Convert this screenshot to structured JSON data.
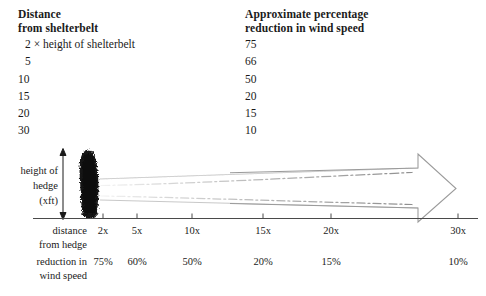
{
  "top_table": {
    "left_column": {
      "header_line1": "Distance",
      "header_line2": "from shelterbelt",
      "rows": [
        "2 × height of shelterbelt",
        "5",
        "10",
        "15",
        "20",
        "30"
      ]
    },
    "right_column": {
      "header_line1": "Approximate percentage",
      "header_line2": "reduction in wind speed",
      "rows": [
        "75",
        "66",
        "50",
        "20",
        "15",
        "10"
      ]
    }
  },
  "diagram": {
    "hedge_label": {
      "line1": "height of",
      "line2": "hedge",
      "line3": "(xft)"
    },
    "distance_label": {
      "line1": "distance",
      "line2": "from hedge"
    },
    "reduction_label": {
      "line1": "reduction in",
      "line2": "wind speed"
    },
    "axis_ticks": [
      {
        "label": "2x",
        "x": 103,
        "pct": "75%"
      },
      {
        "label": "5x",
        "x": 137,
        "pct": "60%"
      },
      {
        "label": "10x",
        "x": 192,
        "pct": "50%"
      },
      {
        "label": "15x",
        "x": 263,
        "pct": "20%"
      },
      {
        "label": "20x",
        "x": 331,
        "pct": "15%"
      },
      {
        "label": "30x",
        "x": 458,
        "pct": "10%"
      }
    ],
    "colors": {
      "ink": "#1a1a1a",
      "axis": "#555555",
      "arrow_outline": "#8c8c8c",
      "wind_stream": "#b5b5b5",
      "hedge": "#141414"
    }
  },
  "chart_data": {
    "type": "table",
    "xlabel": "Distance from shelterbelt (multiples of shelterbelt height)",
    "ylabel": "Approximate percentage reduction in wind speed",
    "columns": [
      "Distance from shelterbelt",
      "Approximate percentage reduction in wind speed"
    ],
    "categories": [
      "2x",
      "5",
      "10",
      "15",
      "20",
      "30"
    ],
    "values": [
      75,
      66,
      50,
      20,
      15,
      10
    ],
    "diagram_categories": [
      "2x",
      "5x",
      "10x",
      "15x",
      "20x",
      "30x"
    ],
    "diagram_values": [
      75,
      60,
      50,
      20,
      15,
      10
    ],
    "units": "percent",
    "grid": false,
    "legend": "none"
  }
}
